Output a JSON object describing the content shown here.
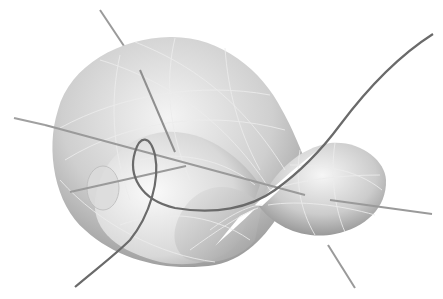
{
  "figure": {
    "title": "",
    "colors": {
      "background": "#ffffff",
      "surface_light": "#f2f2f2",
      "surface_mid": "#c8c8c8",
      "surface_dark": "#8a8a8a",
      "mesh": "#e8e8e8",
      "axis": "#9a9a9a",
      "curve": "#6a6a6a"
    },
    "parts": [
      {
        "id": "large-lobe",
        "label": ""
      },
      {
        "id": "small-lobe",
        "label": ""
      },
      {
        "id": "singular-point",
        "label": ""
      },
      {
        "id": "axis-1",
        "label": ""
      },
      {
        "id": "axis-2",
        "label": ""
      },
      {
        "id": "axis-3",
        "label": ""
      },
      {
        "id": "space-curve",
        "label": ""
      }
    ]
  }
}
